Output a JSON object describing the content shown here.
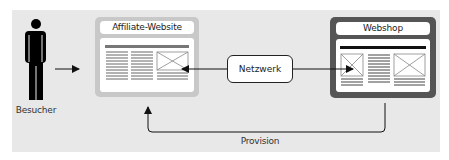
{
  "diagram": {
    "visitor": {
      "label": "Besucher",
      "icon": "person-icon"
    },
    "affiliate": {
      "title": "Affiliate-Website",
      "frame_color": "#c8c8c8"
    },
    "network": {
      "label": "Netzwerk"
    },
    "webshop": {
      "title": "Webshop",
      "frame_color": "#555555"
    },
    "commission": {
      "label": "Provision"
    },
    "colors": {
      "background": "#e8e8e8",
      "line": "#222222",
      "text_lines": "#666666"
    },
    "edges": [
      {
        "from": "visitor",
        "to": "affiliate"
      },
      {
        "from": "network",
        "to": "affiliate"
      },
      {
        "from": "network",
        "to": "webshop"
      },
      {
        "from": "webshop",
        "to": "affiliate",
        "label": "Provision"
      }
    ]
  }
}
